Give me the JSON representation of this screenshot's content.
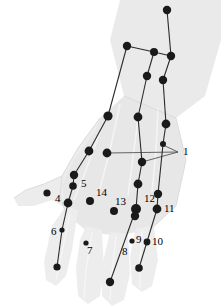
{
  "figure": {
    "background_color": "#ffffff",
    "hand_fill": "#e9e9e9",
    "hand_fill_light": "#f2f2f2",
    "hand_stroke": "#d8d8d8",
    "node_color": "#1a1a1a",
    "link_color": "#2b2b2b",
    "leader_color": "#555555",
    "label_color": "#000000"
  },
  "labels": [
    {
      "id": "1",
      "text": "1",
      "x": 183,
      "y": 155
    },
    {
      "id": "4",
      "text": "4",
      "x": 55,
      "y": 202
    },
    {
      "id": "5",
      "text": "5",
      "x": 81,
      "y": 187
    },
    {
      "id": "6",
      "text": "6",
      "x": 51,
      "y": 235
    },
    {
      "id": "7",
      "text": "7",
      "x": 87,
      "y": 254
    },
    {
      "id": "8",
      "text": "8",
      "x": 122,
      "y": 255
    },
    {
      "id": "9",
      "text": "9",
      "x": 136,
      "y": 243
    },
    {
      "id": "10",
      "text": "10",
      "x": 152,
      "y": 245
    },
    {
      "id": "11",
      "text": "11",
      "x": 164,
      "y": 212
    },
    {
      "id": "12",
      "text": "12",
      "x": 144,
      "y": 202
    },
    {
      "id": "13",
      "text": "13",
      "x": 115,
      "y": 205
    },
    {
      "id": "14",
      "text": "14",
      "x": 96,
      "y": 196
    }
  ],
  "nodes": [
    {
      "id": "n-wrist-top-right",
      "x": 167,
      "y": 10,
      "r": 4.2
    },
    {
      "id": "n-forearm-mid-left",
      "x": 127,
      "y": 46,
      "r": 4.2
    },
    {
      "id": "n-forearm-branch-a",
      "x": 154,
      "y": 52,
      "r": 4.0
    },
    {
      "id": "n-forearm-branch-b",
      "x": 171,
      "y": 56,
      "r": 4.2
    },
    {
      "id": "n-forearm-lower-left",
      "x": 147,
      "y": 76,
      "r": 4.2
    },
    {
      "id": "n-forearm-lower-right",
      "x": 163,
      "y": 80,
      "r": 4.2
    },
    {
      "id": "n-hand-top-left",
      "x": 108,
      "y": 116,
      "r": 4.6
    },
    {
      "id": "n-hand-top-mid",
      "x": 138,
      "y": 117,
      "r": 4.4
    },
    {
      "id": "n-hand-top-right",
      "x": 166,
      "y": 124,
      "r": 4.4
    },
    {
      "id": "n-point-1a",
      "x": 107,
      "y": 153,
      "r": 4.4
    },
    {
      "id": "n-point-1b",
      "x": 142,
      "y": 162,
      "r": 4.2
    },
    {
      "id": "n-ulnar-small",
      "x": 163,
      "y": 144,
      "r": 3.0
    },
    {
      "id": "n-midhand-left",
      "x": 89,
      "y": 151,
      "r": 4.4
    },
    {
      "id": "n-midhand-left2",
      "x": 74,
      "y": 175,
      "r": 4.2
    },
    {
      "id": "n-point-5",
      "x": 73,
      "y": 186,
      "r": 3.8
    },
    {
      "id": "n-point-4",
      "x": 47,
      "y": 193,
      "r": 3.6
    },
    {
      "id": "n-mcp-left",
      "x": 68,
      "y": 203,
      "r": 4.4
    },
    {
      "id": "n-point-6",
      "x": 62,
      "y": 230,
      "r": 2.6
    },
    {
      "id": "n-tip-index",
      "x": 57,
      "y": 267,
      "r": 3.6
    },
    {
      "id": "n-point-7",
      "x": 86,
      "y": 243,
      "r": 2.6
    },
    {
      "id": "n-point-14",
      "x": 90,
      "y": 201,
      "r": 4.0
    },
    {
      "id": "n-point-13",
      "x": 114,
      "y": 211,
      "r": 4.0
    },
    {
      "id": "n-mid-col-a",
      "x": 138,
      "y": 184,
      "r": 4.4
    },
    {
      "id": "n-point-12",
      "x": 136,
      "y": 209,
      "r": 5.0
    },
    {
      "id": "n-point-12b",
      "x": 135,
      "y": 216,
      "r": 4.2
    },
    {
      "id": "n-point-9",
      "x": 132,
      "y": 241,
      "r": 2.6
    },
    {
      "id": "n-tip-middle",
      "x": 110,
      "y": 282,
      "r": 4.2
    },
    {
      "id": "n-point-11",
      "x": 157,
      "y": 209,
      "r": 4.4
    },
    {
      "id": "n-right-col-a",
      "x": 158,
      "y": 194,
      "r": 4.2
    },
    {
      "id": "n-point-10",
      "x": 147,
      "y": 242,
      "r": 3.4
    },
    {
      "id": "n-tip-ring",
      "x": 139,
      "y": 268,
      "r": 3.8
    }
  ],
  "links": [
    {
      "from": "n-wrist-top-right",
      "to": "n-forearm-branch-b"
    },
    {
      "from": "n-forearm-branch-a",
      "to": "n-forearm-branch-b"
    },
    {
      "from": "n-forearm-mid-left",
      "to": "n-forearm-branch-a"
    },
    {
      "from": "n-forearm-branch-b",
      "to": "n-forearm-lower-right"
    },
    {
      "from": "n-forearm-branch-a",
      "to": "n-forearm-lower-left"
    },
    {
      "from": "n-forearm-mid-left",
      "to": "n-hand-top-left"
    },
    {
      "from": "n-forearm-lower-left",
      "to": "n-hand-top-mid"
    },
    {
      "from": "n-forearm-lower-right",
      "to": "n-hand-top-right"
    },
    {
      "from": "n-hand-top-left",
      "to": "n-midhand-left"
    },
    {
      "from": "n-hand-top-mid",
      "to": "n-point-1b"
    },
    {
      "from": "n-point-1b",
      "to": "n-mid-col-a"
    },
    {
      "from": "n-mid-col-a",
      "to": "n-point-12"
    },
    {
      "from": "n-point-12",
      "to": "n-tip-middle"
    },
    {
      "from": "n-hand-top-right",
      "to": "n-ulnar-small"
    },
    {
      "from": "n-ulnar-small",
      "to": "n-right-col-a"
    },
    {
      "from": "n-right-col-a",
      "to": "n-point-11"
    },
    {
      "from": "n-point-11",
      "to": "n-tip-ring"
    },
    {
      "from": "n-midhand-left",
      "to": "n-midhand-left2"
    },
    {
      "from": "n-midhand-left2",
      "to": "n-point-5"
    },
    {
      "from": "n-point-5",
      "to": "n-mcp-left"
    },
    {
      "from": "n-mcp-left",
      "to": "n-point-6"
    },
    {
      "from": "n-point-6",
      "to": "n-tip-index"
    }
  ],
  "leaders": [
    {
      "id": "leader-1-to-point-a",
      "x1": 178,
      "y1": 152,
      "x2": 107,
      "y2": 153
    },
    {
      "id": "leader-1-to-point-b",
      "x1": 178,
      "y1": 152,
      "x2": 142,
      "y2": 162
    },
    {
      "id": "leader-1-to-ulnar",
      "x1": 178,
      "y1": 152,
      "x2": 163,
      "y2": 145
    }
  ]
}
